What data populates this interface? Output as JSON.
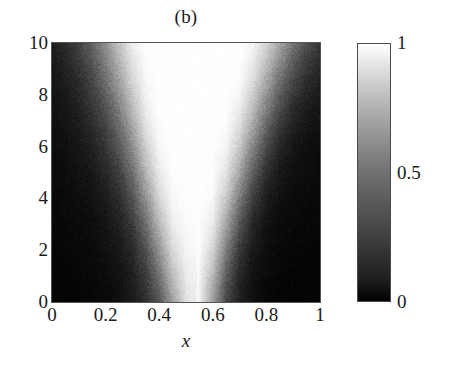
{
  "figure": {
    "title": "(b)",
    "width": 453,
    "height": 365
  },
  "axes": {
    "xlabel": "x",
    "ylabel": "",
    "xticks": [
      "0",
      "0.2",
      "0.4",
      "0.6",
      "0.8",
      "1"
    ],
    "yticks": [
      "0",
      "2",
      "4",
      "6",
      "8",
      "10"
    ]
  },
  "colorbar": {
    "ticks": [
      "0",
      "0.5",
      "1"
    ],
    "low_color": "#000000",
    "high_color": "#ffffff"
  },
  "chart_data": {
    "type": "heatmap",
    "title": "(b)",
    "xlabel": "x",
    "ylabel": "",
    "colormap": "gray",
    "xlim": [
      0,
      1
    ],
    "ylim": [
      0,
      10
    ],
    "zlim": [
      0,
      1
    ],
    "xticks": [
      0,
      0.2,
      0.4,
      0.6,
      0.8,
      1
    ],
    "yticks": [
      0,
      2,
      4,
      6,
      8,
      10
    ],
    "colorbar_ticks": [
      0,
      0.5,
      1
    ],
    "grid": false,
    "legend": "none",
    "cone": {
      "apex_x": 0.54,
      "apex_y": 0.0,
      "left_slope_x_at_ymax": 0.1,
      "right_slope_x_at_ymax": 0.97,
      "edge_softness": 0.11
    },
    "vertical_line": {
      "x": 0.545,
      "y_start": 0.0,
      "y_end": 6.0,
      "value": 1.0
    },
    "noise_amplitude": 0.05,
    "x_grid": [
      0,
      0.05,
      0.1,
      0.15,
      0.2,
      0.25,
      0.3,
      0.35,
      0.4,
      0.45,
      0.5,
      0.55,
      0.6,
      0.65,
      0.7,
      0.75,
      0.8,
      0.85,
      0.9,
      0.95,
      1
    ],
    "y_grid": [
      0,
      0.5,
      1,
      1.5,
      2,
      2.5,
      3,
      3.5,
      4,
      4.5,
      5,
      5.5,
      6,
      6.5,
      7,
      7.5,
      8,
      8.5,
      9,
      9.5,
      10
    ],
    "values": [
      [
        0.02,
        0.02,
        0.02,
        0.03,
        0.04,
        0.06,
        0.1,
        0.18,
        0.33,
        0.62,
        0.88,
        0.95,
        0.62,
        0.28,
        0.12,
        0.06,
        0.03,
        0.02,
        0.02,
        0.02,
        0.02
      ],
      [
        0.02,
        0.02,
        0.02,
        0.03,
        0.04,
        0.06,
        0.11,
        0.2,
        0.38,
        0.68,
        0.9,
        0.95,
        0.66,
        0.31,
        0.13,
        0.06,
        0.03,
        0.02,
        0.02,
        0.02,
        0.02
      ],
      [
        0.02,
        0.02,
        0.03,
        0.03,
        0.05,
        0.07,
        0.12,
        0.23,
        0.44,
        0.74,
        0.92,
        0.96,
        0.72,
        0.36,
        0.15,
        0.07,
        0.04,
        0.02,
        0.02,
        0.02,
        0.02
      ],
      [
        0.02,
        0.02,
        0.03,
        0.04,
        0.05,
        0.08,
        0.14,
        0.27,
        0.51,
        0.8,
        0.94,
        0.97,
        0.78,
        0.42,
        0.18,
        0.08,
        0.04,
        0.03,
        0.02,
        0.02,
        0.02
      ],
      [
        0.02,
        0.03,
        0.03,
        0.04,
        0.06,
        0.09,
        0.16,
        0.31,
        0.58,
        0.85,
        0.96,
        0.98,
        0.83,
        0.49,
        0.22,
        0.1,
        0.05,
        0.03,
        0.03,
        0.02,
        0.02
      ],
      [
        0.03,
        0.03,
        0.04,
        0.05,
        0.07,
        0.11,
        0.19,
        0.37,
        0.65,
        0.89,
        0.97,
        0.99,
        0.88,
        0.56,
        0.27,
        0.12,
        0.06,
        0.04,
        0.03,
        0.03,
        0.02
      ],
      [
        0.03,
        0.03,
        0.04,
        0.05,
        0.08,
        0.13,
        0.23,
        0.43,
        0.72,
        0.93,
        0.98,
        0.99,
        0.92,
        0.64,
        0.33,
        0.15,
        0.07,
        0.04,
        0.03,
        0.03,
        0.03
      ],
      [
        0.03,
        0.04,
        0.05,
        0.06,
        0.09,
        0.15,
        0.27,
        0.5,
        0.78,
        0.95,
        0.99,
        1.0,
        0.95,
        0.71,
        0.4,
        0.19,
        0.09,
        0.05,
        0.04,
        0.03,
        0.03
      ],
      [
        0.03,
        0.04,
        0.05,
        0.07,
        0.11,
        0.18,
        0.32,
        0.57,
        0.84,
        0.97,
        0.99,
        1.0,
        0.97,
        0.78,
        0.48,
        0.24,
        0.11,
        0.06,
        0.04,
        0.04,
        0.03
      ],
      [
        0.04,
        0.04,
        0.06,
        0.08,
        0.13,
        0.21,
        0.37,
        0.64,
        0.88,
        0.98,
        1.0,
        1.0,
        0.98,
        0.84,
        0.56,
        0.3,
        0.14,
        0.08,
        0.05,
        0.04,
        0.04
      ],
      [
        0.04,
        0.05,
        0.07,
        0.09,
        0.15,
        0.25,
        0.43,
        0.7,
        0.92,
        0.99,
        1.0,
        1.0,
        0.99,
        0.89,
        0.64,
        0.37,
        0.18,
        0.09,
        0.06,
        0.05,
        0.04
      ],
      [
        0.04,
        0.05,
        0.08,
        0.11,
        0.18,
        0.29,
        0.49,
        0.76,
        0.95,
        1.0,
        1.0,
        1.0,
        0.99,
        0.93,
        0.71,
        0.44,
        0.23,
        0.12,
        0.07,
        0.05,
        0.04
      ],
      [
        0.05,
        0.06,
        0.09,
        0.13,
        0.21,
        0.34,
        0.55,
        0.81,
        0.97,
        1.0,
        1.0,
        1.0,
        1.0,
        0.96,
        0.78,
        0.52,
        0.29,
        0.15,
        0.09,
        0.06,
        0.05
      ],
      [
        0.05,
        0.07,
        0.1,
        0.15,
        0.24,
        0.39,
        0.61,
        0.86,
        0.98,
        1.0,
        1.0,
        1.0,
        1.0,
        0.97,
        0.84,
        0.6,
        0.35,
        0.19,
        0.11,
        0.07,
        0.06
      ],
      [
        0.06,
        0.08,
        0.12,
        0.18,
        0.28,
        0.44,
        0.67,
        0.9,
        0.99,
        1.0,
        1.0,
        1.0,
        1.0,
        0.99,
        0.89,
        0.67,
        0.42,
        0.24,
        0.14,
        0.09,
        0.07
      ],
      [
        0.06,
        0.09,
        0.13,
        0.21,
        0.32,
        0.5,
        0.73,
        0.93,
        1.0,
        1.0,
        1.0,
        1.0,
        1.0,
        0.99,
        0.93,
        0.74,
        0.5,
        0.3,
        0.17,
        0.11,
        0.08
      ],
      [
        0.07,
        0.1,
        0.15,
        0.24,
        0.37,
        0.56,
        0.78,
        0.95,
        1.0,
        1.0,
        1.0,
        1.0,
        1.0,
        1.0,
        0.96,
        0.8,
        0.57,
        0.36,
        0.22,
        0.14,
        0.1
      ],
      [
        0.08,
        0.12,
        0.17,
        0.27,
        0.42,
        0.62,
        0.83,
        0.97,
        1.0,
        1.0,
        1.0,
        1.0,
        1.0,
        1.0,
        0.98,
        0.86,
        0.65,
        0.43,
        0.27,
        0.17,
        0.12
      ],
      [
        0.09,
        0.13,
        0.2,
        0.31,
        0.47,
        0.67,
        0.87,
        0.98,
        1.0,
        1.0,
        1.0,
        1.0,
        1.0,
        1.0,
        0.99,
        0.9,
        0.72,
        0.5,
        0.33,
        0.21,
        0.15
      ],
      [
        0.1,
        0.15,
        0.23,
        0.35,
        0.52,
        0.72,
        0.9,
        0.99,
        1.0,
        1.0,
        1.0,
        1.0,
        1.0,
        1.0,
        1.0,
        0.94,
        0.78,
        0.58,
        0.39,
        0.26,
        0.18
      ],
      [
        0.11,
        0.17,
        0.26,
        0.39,
        0.57,
        0.77,
        0.93,
        1.0,
        1.0,
        1.0,
        1.0,
        1.0,
        1.0,
        1.0,
        1.0,
        0.96,
        0.84,
        0.65,
        0.46,
        0.31,
        0.22
      ]
    ]
  }
}
